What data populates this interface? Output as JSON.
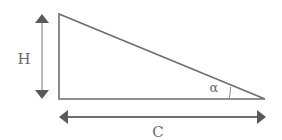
{
  "diagram": {
    "type": "right-triangle",
    "labels": {
      "height": "H",
      "base": "C",
      "angle": "α"
    },
    "colors": {
      "stroke": "#6e6e6e",
      "arrow": "#5a5a5a",
      "text": "#6a6a6a",
      "background": "#ffffff"
    }
  }
}
